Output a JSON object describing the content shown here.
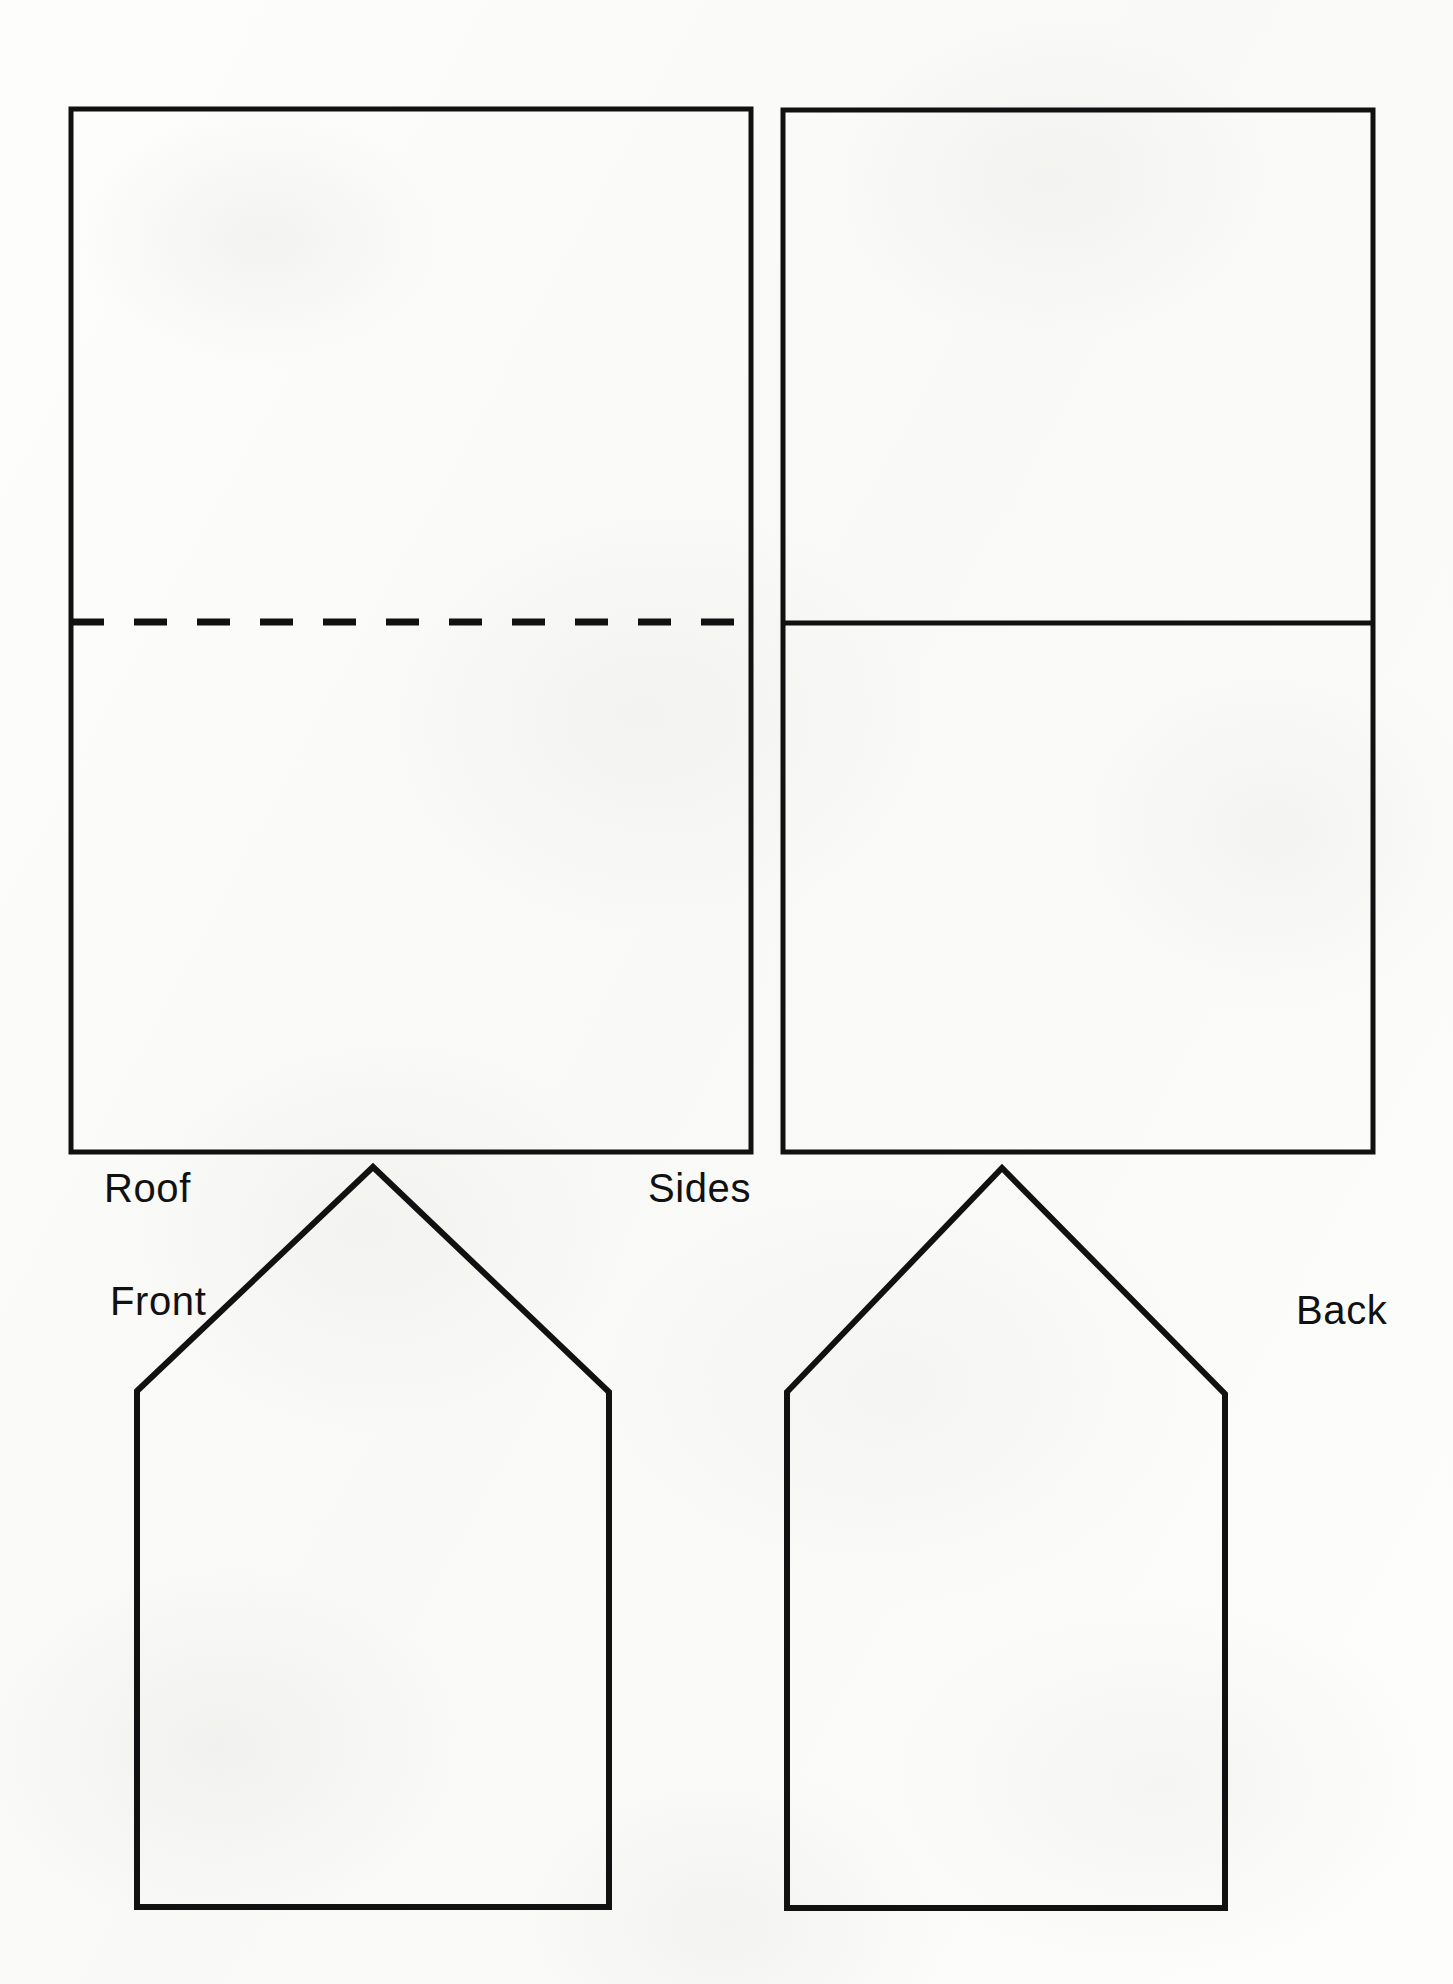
{
  "document": {
    "kind": "paper-craft-cut-out-template",
    "subject": "house",
    "background_color": "#fdfdfc",
    "ink_color": "#111111"
  },
  "shapes": [
    {
      "id": "roof",
      "name": "Roof",
      "form": "rectangle",
      "x": 71,
      "y": 109,
      "width": 680,
      "height": 1043,
      "stroke_width": 5,
      "fold_line": {
        "type": "dashed",
        "orientation": "horizontal",
        "y": 622,
        "x_start": 71,
        "x_end": 751,
        "dash": 33,
        "gap": 30,
        "stroke_width": 7
      }
    },
    {
      "id": "sides",
      "name": "Sides",
      "form": "rectangle",
      "x": 783,
      "y": 110,
      "width": 590,
      "height": 1042,
      "stroke_width": 5,
      "fold_line": {
        "type": "solid",
        "orientation": "horizontal",
        "y": 623,
        "x_start": 783,
        "x_end": 1373,
        "stroke_width": 5
      }
    },
    {
      "id": "front",
      "name": "Front",
      "form": "pentagon",
      "points": "137,1391 373,1167 609,1392 609,1907 137,1907",
      "stroke_width": 6
    },
    {
      "id": "back",
      "name": "Back",
      "form": "pentagon",
      "points": "787,1392 1002,1168 1225,1394 1225,1908 787,1908",
      "stroke_width": 6
    }
  ],
  "labels": [
    {
      "id": "roof-label",
      "text": "Roof",
      "x": 104,
      "y": 1168,
      "align": "left"
    },
    {
      "id": "sides-label",
      "text": "Sides",
      "x": 648,
      "y": 1168,
      "align": "left"
    },
    {
      "id": "front-label",
      "text": "Front",
      "x": 110,
      "y": 1281,
      "align": "left"
    },
    {
      "id": "back-label",
      "text": "Back",
      "x": 1296,
      "y": 1290,
      "align": "left"
    }
  ]
}
